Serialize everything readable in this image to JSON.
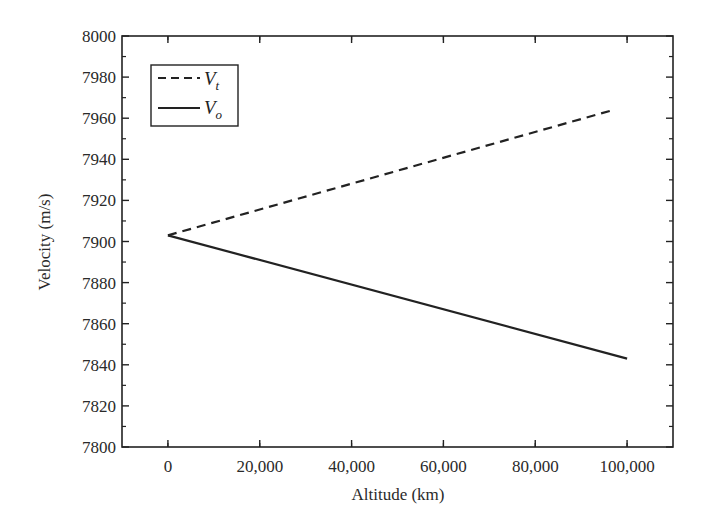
{
  "chart_data": {
    "type": "line",
    "title": "",
    "xlabel": "Altitude (km)",
    "ylabel": "Velocity (m/s)",
    "xlim": [
      -10000,
      110000
    ],
    "ylim": [
      7800,
      8000
    ],
    "x_ticks": [
      0,
      20000,
      40000,
      60000,
      80000,
      100000
    ],
    "x_tick_labels": [
      "0",
      "20,000",
      "40,000",
      "60,000",
      "80,000",
      "100,000"
    ],
    "y_ticks": [
      7800,
      7820,
      7840,
      7860,
      7880,
      7900,
      7920,
      7940,
      7960,
      7980,
      8000
    ],
    "y_tick_labels": [
      "7800",
      "7820",
      "7840",
      "7860",
      "7880",
      "7900",
      "7920",
      "7940",
      "7960",
      "7980",
      "8000"
    ],
    "grid": false,
    "legend_position": "upper left",
    "series": [
      {
        "name": "V_t",
        "label_main": "V",
        "label_sub": "t",
        "style": "dashed",
        "color": "#222222",
        "x": [
          0,
          97000
        ],
        "y": [
          7903,
          7964
        ]
      },
      {
        "name": "V_o",
        "label_main": "V",
        "label_sub": "o",
        "style": "solid",
        "color": "#222222",
        "x": [
          0,
          100000
        ],
        "y": [
          7903,
          7843
        ]
      }
    ]
  }
}
